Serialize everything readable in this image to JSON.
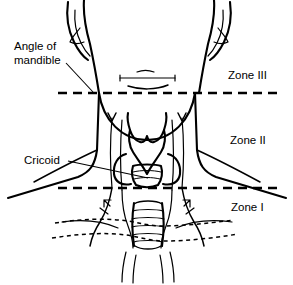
{
  "figure": {
    "width": 293,
    "height": 285,
    "background_color": "#ffffff",
    "ink_color": "#000000",
    "view": "anterior view of neck with larynx, trachea and clavicles"
  },
  "annotations": {
    "angle_of_mandible": {
      "line1": "Angle of",
      "line2": "mandible",
      "x": 14,
      "y1": 50,
      "y2": 64,
      "leader": "M 66,63 L 93,92"
    },
    "cricoid": {
      "text": "Cricoid",
      "x": 24,
      "y": 164,
      "leader": "M 68,161 L 148,178"
    }
  },
  "zones": [
    {
      "name": "zone-3",
      "label": "Zone III",
      "x": 228,
      "y": 79
    },
    {
      "name": "zone-2",
      "label": "Zone II",
      "x": 230,
      "y": 144
    },
    {
      "name": "zone-1",
      "label": "Zone I",
      "x": 231,
      "y": 211
    }
  ],
  "zone_boundaries": [
    {
      "name": "mandible-line",
      "y": 93,
      "x1": 58,
      "x2": 281
    },
    {
      "name": "cricoid-line",
      "y": 188,
      "x1": 58,
      "x2": 281
    }
  ],
  "anatomy": {
    "head_jaw_left": "M 84,0 C 83,14 86,30 90,44 C 93,58 96,74 99,93",
    "head_jaw_right": "M 214,0 C 215,14 212,30 208,44 C 205,58 202,74 199,93",
    "ear_left": "M 68,2 C 66,16 68,30 74,42 C 78,50 82,56 88,60",
    "ear_left_inner": "M 75,10 C 74,22 76,33 81,43 C 84,49 87,53 90,56",
    "ear_left_helix": "M 80,28 C 76,33 72,37 70,42 C 74,44 79,44 84,42",
    "ear_right": "M 230,2 C 232,16 230,30 224,42 C 220,50 216,56 210,60",
    "ear_right_inner": "M 223,10 C 224,22 222,33 217,43 C 214,49 211,53 208,56",
    "ear_right_helix": "M 218,28 C 222,33 226,37 228,42 C 224,44 219,44 214,42",
    "chin_curve": "M 99,93 C 103,120 122,140 147,140 C 172,140 191,120 195,93",
    "chin_detail_line": "M 120,78 L 175,78",
    "chin_detail_tick_left": "M 120,75 L 120,81",
    "chin_detail_tick_right": "M 175,75 L 175,81",
    "chin_detail_arc_top": "M 137,72 C 142,70 149,70 154,72",
    "chin_detail_arc_bottom": "M 128,86 C 140,90 156,90 168,85",
    "neck_left_border": "M 99,93 L 97,150 C 95,165 90,172 78,177 L 8,198",
    "neck_right_border": "M 195,93 L 197,150 C 199,165 204,172 216,177 L 286,198",
    "trapezius_left": "M 97,150 C 84,156 60,168 34,182",
    "trapezius_right": "M 197,150 C 210,156 234,168 260,182",
    "strap_left_outer": "M 112,118 C 110,140 110,165 112,188",
    "strap_left_inner": "M 122,120 C 120,145 120,168 122,190",
    "strap_right_inner": "M 172,120 C 174,145 174,168 172,190",
    "strap_right_outer": "M 182,118 C 184,140 184,165 182,188",
    "notch_v_left": "M 108,113 L 112,121 L 116,113",
    "notch_v_right": "M 178,113 L 182,121 L 186,113",
    "thyroid_cartilage": "M 130,130 C 128,136 129,146 133,152 C 138,160 144,168 147,174 C 150,168 156,160 161,152 C 165,146 166,136 164,130 C 162,136 158,141 154,142 C 150,143 148,140 147,136 C 146,140 144,143 140,142 C 136,141 132,136 130,130 Z",
    "thyroid_horn_left": "M 130,130 C 128,124 127,118 128,113",
    "thyroid_horn_right": "M 164,130 C 166,124 167,118 166,113",
    "thyroid_lobe_left": "M 126,154 C 118,156 113,164 114,174 C 115,182 122,186 131,184",
    "thyroid_lobe_right": "M 168,154 C 176,156 181,164 180,174 C 179,182 172,186 163,184",
    "cricoid_ring": "M 133,166 C 138,164 156,164 161,166 C 163,172 162,180 158,185 C 152,188 142,188 136,185 C 132,180 131,172 133,166 Z",
    "cricoid_band_1": "M 133,172 C 141,170 153,170 161,172",
    "cricoid_band_2": "M 134,179 C 142,177 152,177 160,179",
    "trachea_left": "M 134,203 C 132,215 132,232 134,246",
    "trachea_right": "M 162,203 C 164,215 164,232 162,246",
    "trachea_top": "M 134,204 C 140,200 156,200 162,204",
    "trachea_bottom": "M 135,246 C 141,250 155,250 161,246",
    "trachea_rings": [
      "M 133,211 C 140,209 156,209 163,211",
      "M 132,219 C 140,217 156,217 164,219",
      "M 132,227 C 140,225 156,225 164,227",
      "M 133,235 C 140,233 156,233 163,235",
      "M 134,242 C 140,240 156,240 162,242"
    ],
    "scm_left_lower": "M 112,188 C 110,200 106,212 100,222 C 96,228 92,236 90,246",
    "scm_right_lower": "M 182,188 C 184,200 188,212 194,222 C 198,228 202,236 204,246",
    "scm_left_tendon": "M 122,190 C 122,204 124,216 128,226 C 131,234 133,240 133,248",
    "scm_right_tendon": "M 172,190 C 172,204 170,216 166,226 C 163,234 161,240 161,248",
    "arrow_left_upper": "M 104,200 L 110,206 M 104,200 L 104,207 M 104,200 L 111,200",
    "arrow_left_lower": "M 100,208 L 108,214",
    "arrow_right_upper": "M 190,200 L 184,206 M 190,200 L 190,207 M 190,200 L 183,200",
    "arrow_right_lower": "M 194,208 L 186,214",
    "sternum_notch_left": "M 126,252 C 124,260 122,270 122,282",
    "sternum_notch_right": "M 170,252 C 172,260 174,270 174,282",
    "sternum_center_left": "M 136,255 C 134,265 133,274 133,283",
    "sternum_center_right": "M 160,255 C 162,265 163,274 163,283",
    "clavicle_dotted": [
      "M 55,223 C 80,219 105,218 128,221 C 140,223 150,226 162,226 C 185,226 210,223 234,220",
      "M 52,238 C 78,234 104,232 126,235 C 140,237 150,241 164,241 C 188,241 214,238 238,234"
    ],
    "clavicle_solid_left": "M 62,222 C 84,219 102,221 118,228",
    "clavicle_solid_right": "M 232,222 C 210,219 192,221 176,228"
  }
}
